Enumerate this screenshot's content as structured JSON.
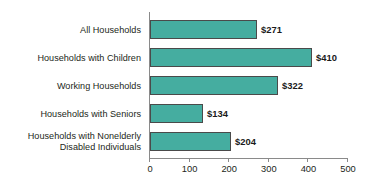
{
  "chart_data": {
    "type": "bar",
    "orientation": "horizontal",
    "title": "",
    "subtitle": "",
    "xlabel": "",
    "ylabel": "",
    "categories": [
      "All Households",
      "Households with Children",
      "Working Households",
      "Households with Seniors",
      "Households with Nonelderly Disabled Individuals"
    ],
    "category_lines": [
      [
        "All Households"
      ],
      [
        "Households with Children"
      ],
      [
        "Working Households"
      ],
      [
        "Households with Seniors"
      ],
      [
        "Households with Nonelderly",
        "Disabled Individuals"
      ]
    ],
    "values": [
      271,
      410,
      322,
      134,
      204
    ],
    "value_labels": [
      "$271",
      "$410",
      "$322",
      "$134",
      "$204"
    ],
    "xlim": [
      0,
      500
    ],
    "xticks": [
      0,
      100,
      200,
      300,
      400,
      500
    ],
    "xtick_labels": [
      "0",
      "100",
      "200",
      "300",
      "400",
      "500"
    ],
    "grid": false,
    "legend": false,
    "bar_color": "#45ada0",
    "bar_border_color": "#4a4a4a",
    "axis_color": "#8a8a8a",
    "text_color": "#231f20"
  }
}
